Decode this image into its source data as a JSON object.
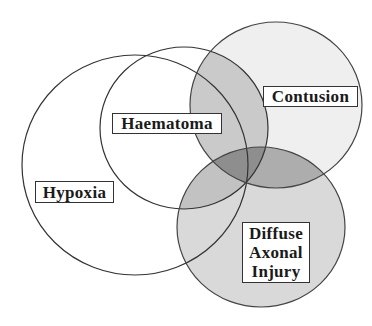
{
  "diagram": {
    "type": "venn",
    "sets": [
      {
        "id": "hypoxia",
        "label": "Hypoxia",
        "shaded": false
      },
      {
        "id": "haematoma",
        "label": "Haematoma",
        "shaded": false
      },
      {
        "id": "contusion",
        "label": "Contusion",
        "shaded": true
      },
      {
        "id": "dai",
        "label_lines": [
          "Diffuse",
          "Axonal",
          "Injury"
        ],
        "shaded": true
      }
    ],
    "colors": {
      "stroke": "#333333",
      "contusion_fill": "#efefef",
      "dai_fill": "#d9d9d9",
      "overlap_light": "#c6c6c6",
      "overlap_dark": "#8e8e8e"
    }
  }
}
